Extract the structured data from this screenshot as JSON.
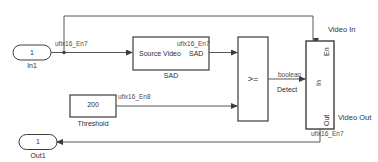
{
  "diagram": {
    "type": "simulink-block-diagram",
    "line_color": "#55565a",
    "block_stroke": "#3c3c3c",
    "block_fill": "#ffffff",
    "background": "#ffffff"
  },
  "ports": {
    "inport": {
      "number": "1",
      "label": "In1"
    },
    "outport": {
      "number": "1",
      "label": "Out1"
    }
  },
  "blocks": {
    "sad": {
      "input_port_label": "Source Video",
      "output_port_label": "SAD",
      "name": "SAD"
    },
    "threshold": {
      "value": "200",
      "name": "Threshold"
    },
    "compare": {
      "operator": ">=",
      "name": "Detect"
    },
    "subsystem": {
      "port_en": "En",
      "port_in": "In",
      "port_out": "Out",
      "label_video_in": "Video In",
      "label_video_out": "Video Out"
    }
  },
  "signals": {
    "in1_to_sad": "ufix16_En7",
    "sad_to_compare": "ufix16_En7",
    "threshold_to_compare": "ufix16_En8",
    "compare_to_subsystem": "boolean",
    "subsystem_to_out1": "ufix16_En7"
  }
}
